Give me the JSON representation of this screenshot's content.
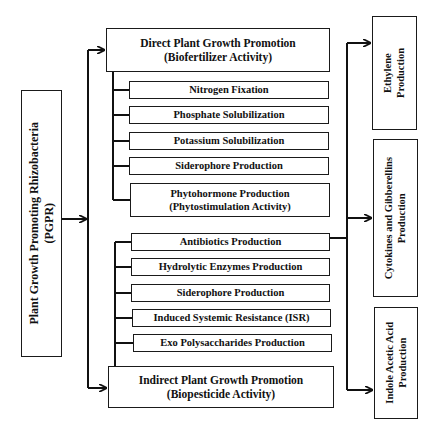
{
  "root": {
    "line1": "Plant Growth Promoting Rhizobacteria",
    "line2": "(PGPR)"
  },
  "direct": {
    "title": "Direct Plant Growth Promotion",
    "subtitle": "(Biofertilizer Activity)",
    "items": [
      {
        "label": "Nitrogen Fixation"
      },
      {
        "label": "Phosphate Solubilization"
      },
      {
        "label": "Potassium Solubilization"
      },
      {
        "label": "Siderophore Production"
      },
      {
        "label": "Phytohormone Production",
        "label2": "(Phytostimulation Activity)"
      }
    ]
  },
  "indirect": {
    "title": "Indirect Plant Growth Promotion",
    "subtitle": "(Biopesticide Activity)",
    "items": [
      {
        "label": "Antibiotics Production"
      },
      {
        "label": "Hydrolytic Enzymes Production"
      },
      {
        "label": "Siderophore Production"
      },
      {
        "label": "Induced Systemic Resistance (ISR)"
      },
      {
        "label": "Exo Polysaccharides Production"
      }
    ]
  },
  "outputs": [
    {
      "line1": "Ethylene",
      "line2": "Production"
    },
    {
      "line1": "Cytokines and Gibberellins",
      "line2": "Production"
    },
    {
      "line1": "Indole Acetic Acid",
      "line2": "Production"
    }
  ]
}
